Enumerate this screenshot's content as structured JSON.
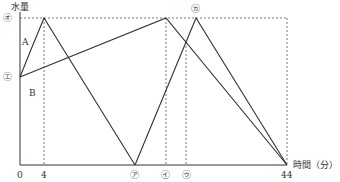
{
  "diagram": {
    "y_axis_label": "水量",
    "x_axis_label": "時間（分）",
    "y_ticks": [
      {
        "label": "㋔",
        "meaning": "max level"
      },
      {
        "label": "㋓",
        "meaning": "initial level"
      }
    ],
    "x_ticks": [
      {
        "label": "0"
      },
      {
        "label": "4"
      },
      {
        "label": "㋐"
      },
      {
        "label": "㋑"
      },
      {
        "label": "㋒"
      },
      {
        "label": "44"
      }
    ],
    "peak_marker": "㋕",
    "line_labels": {
      "a": "A",
      "b": "B"
    }
  }
}
